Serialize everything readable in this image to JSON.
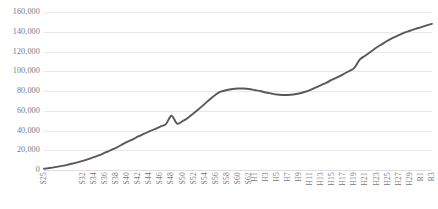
{
  "chart_data": {
    "type": "line",
    "title": "",
    "subtitle": "",
    "xlabel": "",
    "ylabel": "",
    "grid": "horizontal",
    "legend": "none",
    "ylim": [
      0,
      160000
    ],
    "yticks": [
      0,
      20000,
      40000,
      60000,
      80000,
      100000,
      120000,
      140000,
      160000
    ],
    "ytick_labels": [
      "0",
      "20,000",
      "40,000",
      "60,000",
      "80,000",
      "100,000",
      "120,000",
      "140,000",
      "160,000"
    ],
    "xtick_labels": [
      "S25",
      "S32",
      "S34",
      "S36",
      "S38",
      "S40",
      "S42",
      "S44",
      "S46",
      "S48",
      "S50",
      "S52",
      "S54",
      "S56",
      "S58",
      "S60",
      "S62",
      "H1",
      "H3",
      "H5",
      "H7",
      "H9",
      "H11",
      "H13",
      "H15",
      "H17",
      "H19",
      "H21",
      "H23",
      "H25",
      "H27",
      "H29",
      "R1",
      "R3"
    ],
    "series": [
      {
        "name": "series-1",
        "color": "#595959",
        "x": [
          "S25",
          "S26",
          "S27",
          "S28",
          "S29",
          "S30",
          "S31",
          "S32",
          "S33",
          "S34",
          "S35",
          "S36",
          "S37",
          "S38",
          "S39",
          "S40",
          "S41",
          "S42",
          "S43",
          "S44",
          "S45",
          "S46",
          "S47",
          "S48",
          "S49",
          "S50",
          "S51",
          "S52",
          "S53",
          "S54",
          "S55",
          "S56",
          "S57",
          "S58",
          "S59",
          "S60",
          "S61",
          "S62",
          "H1",
          "H2",
          "H3",
          "H4",
          "H5",
          "H6",
          "H7",
          "H8",
          "H9",
          "H10",
          "H11",
          "H12",
          "H13",
          "H14",
          "H15",
          "H16",
          "H17",
          "H18",
          "H19",
          "H20",
          "H21",
          "H22",
          "H23",
          "H24",
          "H25",
          "H26",
          "H27",
          "H28",
          "H29",
          "H30",
          "R1",
          "R2",
          "R3"
        ],
        "values": [
          1200,
          2000,
          2900,
          3900,
          5000,
          6300,
          7700,
          9200,
          11000,
          13000,
          15000,
          17500,
          20000,
          22500,
          25500,
          28500,
          31000,
          34000,
          36500,
          39000,
          41500,
          44000,
          46500,
          55000,
          47000,
          49500,
          53000,
          57500,
          62000,
          67000,
          72000,
          76500,
          79500,
          81000,
          82000,
          82500,
          82500,
          82000,
          81000,
          80000,
          78500,
          77500,
          76500,
          76000,
          76000,
          76500,
          77500,
          79000,
          81000,
          83500,
          86000,
          88500,
          91500,
          94000,
          97000,
          100000,
          103500,
          112000,
          116000,
          120000,
          124000,
          127500,
          131000,
          134000,
          136500,
          139000,
          141000,
          143000,
          144500,
          146500,
          148000
        ]
      }
    ]
  }
}
